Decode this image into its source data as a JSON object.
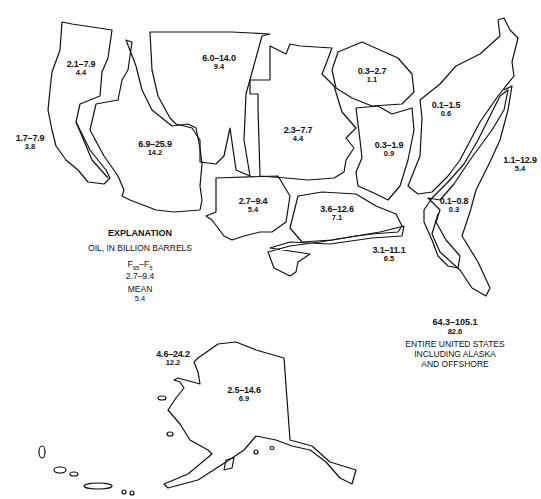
{
  "map": {
    "subject": "Oil resource estimates by region",
    "unit": "billion barrels",
    "regions": [
      {
        "id": "pacific-northwest",
        "range": "2.1–7.9",
        "mean": "4.4"
      },
      {
        "id": "pacific-offshore",
        "range": "1.7–7.9",
        "mean": "3.8"
      },
      {
        "id": "great-basin",
        "range": "6.9–25.9",
        "mean": "14.2"
      },
      {
        "id": "northern-rockies",
        "range": "6.0–14.0",
        "mean": "9.4"
      },
      {
        "id": "mid-continent",
        "range": "2.3–7.7",
        "mean": "4.4"
      },
      {
        "id": "west-texas-permian",
        "range": "2.7–9.4",
        "mean": "5.4"
      },
      {
        "id": "gulf-coast-onshore",
        "range": "3.6–12.6",
        "mean": "7.1"
      },
      {
        "id": "gulf-offshore",
        "range": "3.1–11.1",
        "mean": "6.5"
      },
      {
        "id": "michigan-basin",
        "range": "0.3–2.7",
        "mean": "1.1"
      },
      {
        "id": "illinois-basin",
        "range": "0.3–1.9",
        "mean": "0.9"
      },
      {
        "id": "appalachian",
        "range": "0.1–1.5",
        "mean": "0.6"
      },
      {
        "id": "atlantic-offshore",
        "range": "1.1–12.9",
        "mean": "5.4"
      },
      {
        "id": "atlantic-coastal-plain",
        "range": "0.1–0.8",
        "mean": "0.3"
      },
      {
        "id": "alaska-offshore",
        "range": "4.6–24.2",
        "mean": "12.2"
      },
      {
        "id": "alaska-onshore",
        "range": "2.5–14.6",
        "mean": "6.9"
      }
    ]
  },
  "legend": {
    "title": "EXPLANATION",
    "unit_label": "OIL, IN BILLION BARRELS",
    "fractile_header_main": "F",
    "fractile_sub_95": "95",
    "fractile_dash": "–F",
    "fractile_sub_5": "5",
    "example_range": "2.7–9.4",
    "mean_header": "MEAN",
    "example_mean": "5.4"
  },
  "total": {
    "range": "64.3–105.1",
    "mean": "82.6",
    "caption_line1": "ENTIRE UNITED STATES",
    "caption_line2": "INCLUDING ALASKA",
    "caption_line3": "AND OFFSHORE"
  }
}
